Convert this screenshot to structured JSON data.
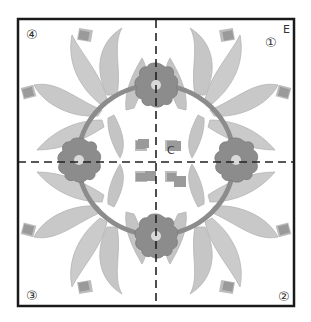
{
  "diagram": {
    "title": "",
    "type": "quilt-applique-block-pattern",
    "quadrant_labels": [
      {
        "id": "q1",
        "text": "①",
        "position": "top-right"
      },
      {
        "id": "q2",
        "text": "②",
        "position": "bottom-right"
      },
      {
        "id": "q3",
        "text": "③",
        "position": "bottom-left"
      },
      {
        "id": "q4",
        "text": "④",
        "position": "top-left"
      }
    ],
    "point_labels": [
      {
        "id": "edge",
        "text": "E",
        "meaning": "edge marker at top-right corner"
      },
      {
        "id": "center",
        "text": "C",
        "meaning": "center marker"
      }
    ],
    "guides": {
      "vertical_center_line": "dashed",
      "horizontal_center_line": "dashed"
    },
    "motifs": {
      "wreath_ring": "stem ring connecting four flowers",
      "flowers": 4,
      "leaf_sprays": 4,
      "tulip_buds_per_quadrant": 3
    },
    "colors": {
      "border": "#1a1a1a",
      "leaf": "#c9c9c9",
      "leaf_outline": "#b0b0b0",
      "flower": "#8a8a8a",
      "flower_center": "#d8d8d8",
      "stem": "#8c8c8c",
      "bud": "#9a9a9a",
      "bud_halo": "#bdbdbd",
      "dash": "#222222"
    }
  }
}
